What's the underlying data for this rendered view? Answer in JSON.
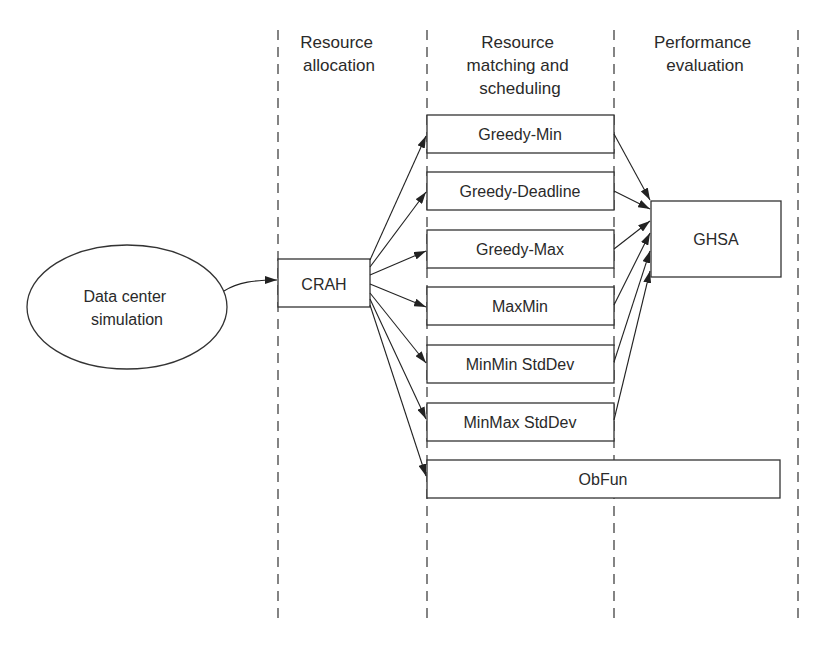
{
  "columns": [
    {
      "id": "resource-allocation",
      "lines": [
        "Resource",
        "allocation"
      ]
    },
    {
      "id": "resource-matching",
      "lines": [
        "Resource",
        "matching and",
        "scheduling"
      ]
    },
    {
      "id": "performance-evaluation",
      "lines": [
        "Performance",
        "evaluation"
      ]
    }
  ],
  "nodes": {
    "source": {
      "lines": [
        "Data center",
        "simulation"
      ]
    },
    "crah": {
      "label": "CRAH"
    },
    "algorithms": [
      {
        "label": "Greedy-Min"
      },
      {
        "label": "Greedy-Deadline"
      },
      {
        "label": "Greedy-Max"
      },
      {
        "label": "MaxMin"
      },
      {
        "label": "MinMin StdDev"
      },
      {
        "label": "MinMax StdDev"
      }
    ],
    "obfun": {
      "label": "ObFun"
    },
    "ghsa": {
      "label": "GHSA"
    }
  },
  "edges": [
    [
      "Data center simulation",
      "CRAH"
    ],
    [
      "CRAH",
      "Greedy-Min"
    ],
    [
      "CRAH",
      "Greedy-Deadline"
    ],
    [
      "CRAH",
      "Greedy-Max"
    ],
    [
      "CRAH",
      "MaxMin"
    ],
    [
      "CRAH",
      "MinMin StdDev"
    ],
    [
      "CRAH",
      "MinMax StdDev"
    ],
    [
      "CRAH",
      "ObFun"
    ],
    [
      "Greedy-Min",
      "GHSA"
    ],
    [
      "Greedy-Deadline",
      "GHSA"
    ],
    [
      "Greedy-Max",
      "GHSA"
    ],
    [
      "MaxMin",
      "GHSA"
    ],
    [
      "MinMin StdDev",
      "GHSA"
    ],
    [
      "MinMax StdDev",
      "GHSA"
    ]
  ]
}
